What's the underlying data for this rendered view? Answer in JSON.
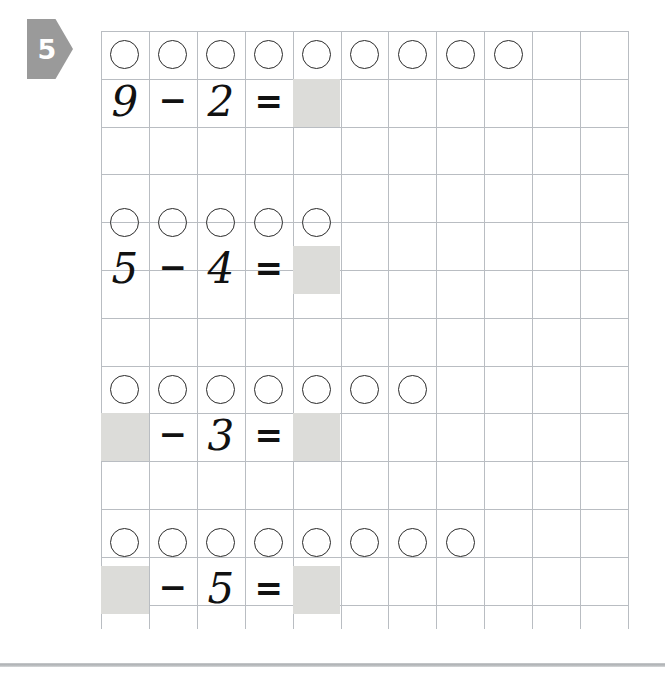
{
  "worksheet": {
    "exercise_number": "5",
    "marker_icon": "triangle-right-arrow",
    "marker_color": "#9a9a9a",
    "grid": {
      "columns": 12,
      "rows": 12,
      "cell_size_px": 48,
      "line_color": "#b9bdc2"
    },
    "shaded_cell_color": "#dcdcd9",
    "circle_icon": "counter-circle",
    "operator_minus": "−",
    "operator_equals": "=",
    "problems": [
      {
        "index": 1,
        "circle_count": 9,
        "minuend": "9",
        "subtrahend": "2",
        "minuend_blank": false,
        "answer_blank": true,
        "answer": ""
      },
      {
        "index": 2,
        "circle_count": 5,
        "minuend": "5",
        "subtrahend": "4",
        "minuend_blank": false,
        "answer_blank": true,
        "answer": ""
      },
      {
        "index": 3,
        "circle_count": 7,
        "minuend": "",
        "subtrahend": "3",
        "minuend_blank": true,
        "answer_blank": true,
        "answer": ""
      },
      {
        "index": 4,
        "circle_count": 8,
        "minuend": "",
        "subtrahend": "5",
        "minuend_blank": true,
        "answer_blank": true,
        "answer": ""
      }
    ]
  }
}
